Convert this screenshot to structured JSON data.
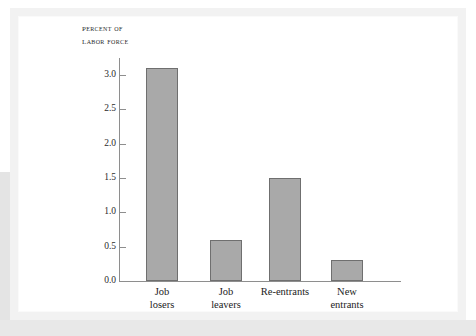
{
  "figure": {
    "axis_title_line1": "Percent of",
    "axis_title_line2": "Labor force"
  },
  "chart_data": {
    "type": "bar",
    "title": "",
    "axis_title": "PERCENT OF LABOR FORCE",
    "xlabel": "",
    "ylabel": "Percent of labor force",
    "ylim": [
      0.0,
      3.25
    ],
    "grid": false,
    "legend": "none",
    "categories": [
      "Job\nlosers",
      "Job\nleavers",
      "Re-entrants",
      "New\nentrants"
    ],
    "category_labels_flat": [
      "Job losers",
      "Job leavers",
      "Re-entrants",
      "New entrants"
    ],
    "values": [
      3.1,
      0.6,
      1.5,
      0.3
    ],
    "ytick_labels": [
      "0.0",
      "0.5",
      "1.0",
      "1.5",
      "2.0",
      "2.5",
      "3.0"
    ],
    "ytick_values": [
      0.0,
      0.5,
      1.0,
      1.5,
      2.0,
      2.5,
      3.0
    ],
    "bar_fill": "#a9a9a9",
    "bar_stroke": "#6f6f6f",
    "axis_color": "#8e8e8e"
  }
}
